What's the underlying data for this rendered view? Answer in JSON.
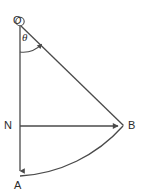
{
  "figure": {
    "background_color": "#ffffff",
    "stroke_color": "#4a4a4a",
    "text_color": "#2b2b2b",
    "width": 142,
    "height": 194,
    "labels": {
      "origin": "O",
      "node_n": "N",
      "node_b": "B",
      "node_a": "A",
      "angle": "θ"
    },
    "points": {
      "O": {
        "x": 20,
        "y": 26
      },
      "N": {
        "x": 20,
        "y": 126
      },
      "A": {
        "x": 20,
        "y": 176
      },
      "B": {
        "x": 123,
        "y": 126
      }
    },
    "segments": [
      {
        "name": "vertical-axis-OA",
        "from": "O",
        "to": "A",
        "arrowhead_at": "A"
      },
      {
        "name": "radius-OB",
        "from": "O",
        "to": "B",
        "arrowhead_at": "none"
      },
      {
        "name": "horizontal-NB",
        "from": "N",
        "to": "B",
        "arrowhead_at": "B"
      }
    ],
    "arc": {
      "name": "arc-AB",
      "from": "A",
      "to": "B",
      "center": "O",
      "radius": 150
    },
    "angle_arc": {
      "name": "angle-arc-theta",
      "vertex": "O",
      "radius": 26,
      "arrowhead_at": "radius-OB"
    }
  }
}
